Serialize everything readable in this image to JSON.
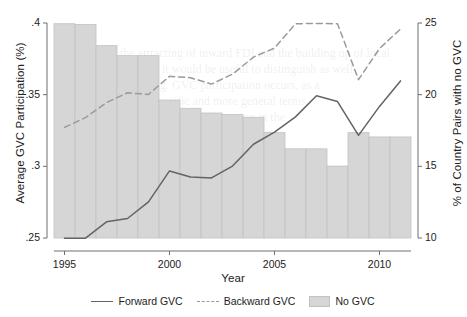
{
  "chart_data": {
    "type": "line",
    "title": "",
    "subtitle": "",
    "xlabel": "Year",
    "ylabel": "Average GVC Participation (%)",
    "ylabel_right": "% of Country Pairs with no GVC",
    "grid": false,
    "legend_position": "bottom",
    "x": [
      1995,
      1996,
      1997,
      1998,
      1999,
      2000,
      2001,
      2002,
      2003,
      2004,
      2005,
      2006,
      2007,
      2008,
      2009,
      2010,
      2011
    ],
    "xticks": [
      1995,
      2000,
      2005,
      2010
    ],
    "xtick_labels": [
      "1995",
      "2000",
      "2005",
      "2010"
    ],
    "xlim": [
      1994.5,
      2011.5
    ],
    "yticks_left": [
      0.25,
      0.3,
      0.35,
      0.4
    ],
    "ytick_labels_left": [
      ".25",
      ".3",
      ".35",
      ".4"
    ],
    "ylim_left": [
      0.25,
      0.4
    ],
    "yticks_right": [
      10,
      15,
      20,
      25
    ],
    "ytick_labels_right": [
      "10",
      "15",
      "20",
      "25"
    ],
    "ylim_right": [
      10,
      25
    ],
    "series": [
      {
        "name": "Forward GVC",
        "type": "line",
        "style": "solid",
        "axis": "left",
        "color": "#646464",
        "values": [
          0.2498,
          0.2499,
          0.2613,
          0.2636,
          0.2752,
          0.2968,
          0.2925,
          0.2919,
          0.3002,
          0.3154,
          0.3238,
          0.3345,
          0.3492,
          0.3452,
          0.3216,
          0.3418,
          0.3596
        ]
      },
      {
        "name": "Backward GVC",
        "type": "line",
        "style": "dashed",
        "axis": "right",
        "color": "#9a9a9a",
        "values": [
          17.72,
          18.4,
          19.45,
          20.13,
          20.02,
          21.28,
          21.18,
          20.74,
          21.43,
          22.62,
          23.25,
          24.95,
          24.97,
          24.95,
          21.05,
          23.22,
          24.58
        ]
      },
      {
        "name": "No GVC",
        "type": "bar",
        "style": "filled",
        "axis": "right",
        "color": "#d6d6d6",
        "edge_color": "#c2c2c2",
        "values": [
          24.95,
          24.9,
          23.42,
          22.72,
          22.72,
          19.62,
          19.05,
          18.72,
          18.62,
          18.42,
          17.35,
          16.22,
          16.22,
          15.02,
          17.35,
          17.05,
          17.05
        ]
      }
    ]
  },
  "legend": {
    "items": [
      {
        "label": "Forward GVC",
        "swatch": "line-solid-swatch"
      },
      {
        "label": "Backward GVC",
        "swatch": "line-dashed-swatch"
      },
      {
        "label": "No GVC",
        "swatch": "bar-block-swatch"
      }
    ]
  },
  "colors": {
    "background": "#ffffff",
    "bar_fill": "#d6d6d6",
    "bar_edge": "#c2c2c2",
    "forward_line": "#646464",
    "backward_line": "#9a9a9a",
    "axis": "#6e6e6e",
    "text": "#222222"
  },
  "background_bleed": [
    {
      "text": "the attracting of inward FDI and the building up of local",
      "x": 120,
      "y": 46
    },
    {
      "text": "tems. Here, it would be useful to distinguish as well",
      "x": 104,
      "y": 62
    },
    {
      "text": "sequencing. GVC participation occurs, as a",
      "x": 112,
      "y": 78
    },
    {
      "text": "both specific and more general terms",
      "x": 128,
      "y": 94
    },
    {
      "text": "structural transformation in the",
      "x": 136,
      "y": 110
    },
    {
      "text": "rates and technology diffusion",
      "x": 126,
      "y": 126
    },
    {
      "text": "are critical in evaluating",
      "x": 144,
      "y": 142
    }
  ]
}
